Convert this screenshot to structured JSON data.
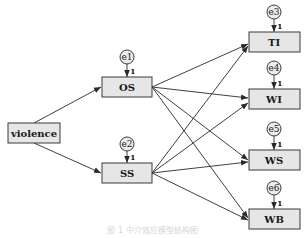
{
  "diagram": {
    "type": "structural-equation-model",
    "nodes": {
      "violence": {
        "label": "violence"
      },
      "OS": {
        "label": "OS",
        "error": "e1",
        "loading": "1"
      },
      "SS": {
        "label": "SS",
        "error": "e2",
        "loading": "1"
      },
      "TI": {
        "label": "TI",
        "error": "e3",
        "loading": "1"
      },
      "WI": {
        "label": "WI",
        "error": "e4",
        "loading": "1"
      },
      "WS": {
        "label": "WS",
        "error": "e5",
        "loading": "1"
      },
      "WB": {
        "label": "WB",
        "error": "e6",
        "loading": "1"
      }
    },
    "edges": [
      [
        "violence",
        "OS"
      ],
      [
        "violence",
        "SS"
      ],
      [
        "OS",
        "TI"
      ],
      [
        "OS",
        "WI"
      ],
      [
        "OS",
        "WS"
      ],
      [
        "OS",
        "WB"
      ],
      [
        "SS",
        "TI"
      ],
      [
        "SS",
        "WI"
      ],
      [
        "SS",
        "WS"
      ],
      [
        "SS",
        "WB"
      ]
    ],
    "caption": "图 1   中介效应模型结构图"
  }
}
